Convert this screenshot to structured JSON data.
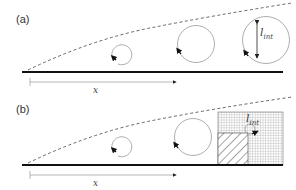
{
  "figure": {
    "panels": [
      {
        "label": "(a)",
        "x_label": "x",
        "length_label": {
          "main": "l",
          "sub": "int"
        },
        "eddies": [
          "small-eddy",
          "medium-eddy",
          "large-eddy"
        ]
      },
      {
        "label": "(b)",
        "x_label": "x",
        "length_label": {
          "main": "l",
          "sub": "int"
        },
        "eddies": [
          "small-eddy",
          "medium-eddy"
        ],
        "regions": [
          "fine-grid-region",
          "hatched-wall-region"
        ]
      }
    ],
    "colors": {
      "wall": "#111111",
      "outline": "#888888",
      "dashed": "#555555",
      "grid": "#8a8a8a"
    }
  }
}
